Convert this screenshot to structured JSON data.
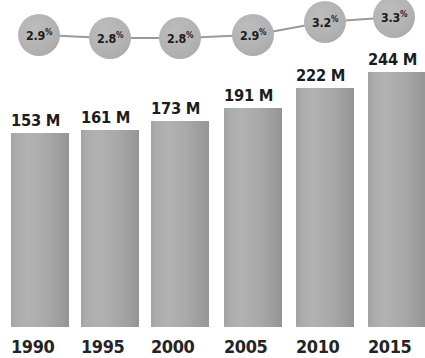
{
  "chart_data": {
    "type": "bar",
    "title": "",
    "subtitle": "",
    "xlabel": "",
    "ylabel": "",
    "categories": [
      "1990",
      "1995",
      "2000",
      "2005",
      "2010",
      "2015"
    ],
    "series": [
      {
        "name": "Total",
        "unit": "M",
        "value_labels": [
          "153 M",
          "161 M",
          "173 M",
          "191 M",
          "222 M",
          "244 M"
        ],
        "values": [
          153,
          161,
          173,
          191,
          222,
          244
        ]
      },
      {
        "name": "Percent",
        "unit": "%",
        "value_labels": [
          "2.9%",
          "2.8%",
          "2.8%",
          "2.9%",
          "3.2%",
          "3.3%"
        ],
        "values": [
          2.9,
          2.8,
          2.8,
          2.9,
          3.2,
          3.3
        ],
        "marker": "bubble"
      }
    ],
    "grid": false,
    "legend": false,
    "legend_position": "none",
    "ylim": [
      0,
      280
    ],
    "bubble_ylim": [
      2.6,
      3.45
    ],
    "colors": {
      "bar_light": "#b2b2b2",
      "bar_dark": "#949494",
      "bubble": "#b3b3b3",
      "connector": "#9a9a9a",
      "text": "#1c1c1c",
      "background": "#ffffff"
    }
  },
  "bars": [
    {
      "value_label": "153 M",
      "year": "1990",
      "pct_label": "2.9",
      "pct_symbol": "%",
      "x": 11,
      "width": 58,
      "top": 133,
      "bottom": 327,
      "bubble_cx": 39,
      "bubble_cy": 35,
      "bubble_r": 21,
      "value_label_x": 11,
      "value_label_y": 111,
      "year_label_x": 11,
      "year_label_y": 337
    },
    {
      "value_label": "161 M",
      "year": "1995",
      "pct_label": "2.8",
      "pct_symbol": "%",
      "x": 81,
      "width": 58,
      "top": 130,
      "bottom": 327,
      "bubble_cx": 110,
      "bubble_cy": 38,
      "bubble_r": 21,
      "value_label_x": 81,
      "value_label_y": 108,
      "year_label_x": 81,
      "year_label_y": 337
    },
    {
      "value_label": "173 M",
      "year": "2000",
      "pct_label": "2.8",
      "pct_symbol": "%",
      "x": 151,
      "width": 58,
      "top": 121,
      "bottom": 327,
      "bubble_cx": 180,
      "bubble_cy": 38,
      "bubble_r": 21,
      "value_label_x": 151,
      "value_label_y": 99,
      "year_label_x": 151,
      "year_label_y": 337
    },
    {
      "value_label": "191 M",
      "year": "2005",
      "pct_label": "2.9",
      "pct_symbol": "%",
      "x": 224,
      "width": 58,
      "top": 108,
      "bottom": 327,
      "bubble_cx": 253,
      "bubble_cy": 35,
      "bubble_r": 21,
      "value_label_x": 224,
      "value_label_y": 86,
      "year_label_x": 224,
      "year_label_y": 337
    },
    {
      "value_label": "222 M",
      "year": "2010",
      "pct_label": "3.2",
      "pct_symbol": "%",
      "x": 296,
      "width": 58,
      "top": 88,
      "bottom": 327,
      "bubble_cx": 325,
      "bubble_cy": 22,
      "bubble_r": 21,
      "value_label_x": 296,
      "value_label_y": 66,
      "year_label_x": 296,
      "year_label_y": 337
    },
    {
      "value_label": "244 M",
      "year": "2015",
      "pct_label": "3.3",
      "pct_symbol": "%",
      "x": 368,
      "width": 58,
      "top": 72,
      "bottom": 327,
      "bubble_cx": 394,
      "bubble_cy": 17,
      "bubble_r": 21,
      "value_label_x": 368,
      "value_label_y": 50,
      "year_label_x": 368,
      "year_label_y": 337
    }
  ]
}
